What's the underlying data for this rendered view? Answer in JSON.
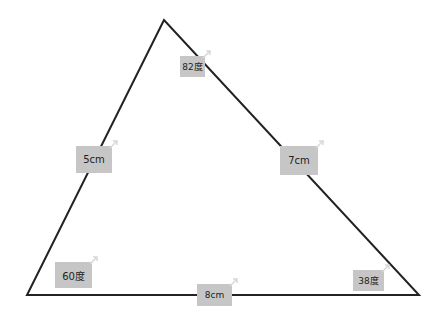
{
  "diagram": {
    "type": "triangle",
    "colors": {
      "line": "#222222",
      "label_bg": "#c6c6c6",
      "label_text": "#222222",
      "arrow": "#d8d8d8"
    },
    "vertices": {
      "top": [
        164,
        20
      ],
      "bottom_left": [
        27,
        295
      ],
      "bottom_right": [
        419,
        295
      ]
    },
    "angles": [
      {
        "id": "top",
        "text": "82度"
      },
      {
        "id": "bottom_left",
        "text": "60度"
      },
      {
        "id": "bottom_right",
        "text": "38度"
      }
    ],
    "sides": [
      {
        "id": "left",
        "text": "5cm"
      },
      {
        "id": "right",
        "text": "7cm"
      },
      {
        "id": "bottom",
        "text": "8cm"
      }
    ]
  }
}
